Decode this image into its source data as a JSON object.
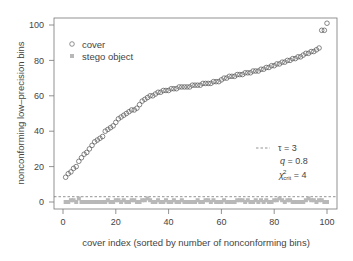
{
  "chart_data": {
    "type": "scatter",
    "title": "",
    "xlabel": "cover index (sorted by number of nonconforming bins)",
    "ylabel": "nonconforming low–precision bins",
    "xlim": [
      -2,
      104
    ],
    "ylim": [
      -4,
      104
    ],
    "xticks": [
      0,
      20,
      40,
      60,
      80,
      100
    ],
    "yticks": [
      0,
      20,
      40,
      60,
      80,
      100
    ],
    "grid": false,
    "legend_position": "top-left",
    "series": [
      {
        "name": "cover",
        "marker": "open-circle",
        "color": "#555555",
        "x": [
          1,
          2,
          3,
          4,
          5,
          6,
          7,
          8,
          9,
          10,
          11,
          12,
          13,
          14,
          15,
          16,
          17,
          18,
          19,
          20,
          21,
          22,
          23,
          24,
          25,
          26,
          27,
          28,
          29,
          30,
          31,
          32,
          33,
          34,
          35,
          36,
          37,
          38,
          39,
          40,
          41,
          42,
          43,
          44,
          45,
          46,
          47,
          48,
          49,
          50,
          51,
          52,
          53,
          54,
          55,
          56,
          57,
          58,
          59,
          60,
          61,
          62,
          63,
          64,
          65,
          66,
          67,
          68,
          69,
          70,
          71,
          72,
          73,
          74,
          75,
          76,
          77,
          78,
          79,
          80,
          81,
          82,
          83,
          84,
          85,
          86,
          87,
          88,
          89,
          90,
          91,
          92,
          93,
          94,
          95,
          96,
          97,
          98,
          99,
          100
        ],
        "values": [
          14,
          16,
          17,
          19,
          20,
          23,
          25,
          27,
          28,
          30,
          32,
          34,
          35,
          36,
          37,
          40,
          41,
          42,
          43,
          45,
          47,
          48,
          49,
          50,
          51,
          52,
          52,
          53,
          55,
          57,
          58,
          59,
          60,
          60,
          61,
          62,
          62,
          63,
          63,
          63,
          64,
          64,
          64,
          65,
          65,
          65,
          65,
          65,
          66,
          66,
          66,
          66,
          67,
          67,
          67,
          67,
          68,
          68,
          68,
          69,
          70,
          70,
          71,
          71,
          71,
          72,
          72,
          72,
          73,
          73,
          73,
          74,
          74,
          74,
          75,
          75,
          76,
          76,
          77,
          77,
          78,
          78,
          79,
          79,
          80,
          80,
          81,
          81,
          82,
          82,
          83,
          84,
          84,
          85,
          85,
          86,
          87,
          97,
          97,
          101
        ]
      },
      {
        "name": "stego object",
        "marker": "filled-square",
        "color": "#b0b0b0",
        "x": [
          1,
          2,
          3,
          4,
          5,
          6,
          7,
          8,
          9,
          10,
          11,
          12,
          13,
          14,
          15,
          16,
          17,
          18,
          19,
          20,
          21,
          22,
          23,
          24,
          25,
          26,
          27,
          28,
          29,
          30,
          31,
          32,
          33,
          34,
          35,
          36,
          37,
          38,
          39,
          40,
          41,
          42,
          43,
          44,
          45,
          46,
          47,
          48,
          49,
          50,
          51,
          52,
          53,
          54,
          55,
          56,
          57,
          58,
          59,
          60,
          61,
          62,
          63,
          64,
          65,
          66,
          67,
          68,
          69,
          70,
          71,
          72,
          73,
          74,
          75,
          76,
          77,
          78,
          79,
          80,
          81,
          82,
          83,
          84,
          85,
          86,
          87,
          88,
          89,
          90,
          91,
          92,
          93,
          94,
          95,
          96,
          97,
          98,
          99,
          100
        ],
        "values": [
          0,
          0,
          1,
          1,
          0,
          2,
          0,
          0,
          0,
          0,
          0,
          0,
          0,
          0,
          0,
          0,
          1,
          0,
          0,
          1,
          1,
          0,
          1,
          0,
          0,
          1,
          1,
          0,
          0,
          1,
          1,
          2,
          1,
          0,
          0,
          1,
          0,
          0,
          1,
          0,
          0,
          1,
          0,
          0,
          1,
          0,
          0,
          0,
          0,
          0,
          1,
          0,
          0,
          1,
          1,
          0,
          1,
          0,
          0,
          0,
          1,
          0,
          0,
          0,
          0,
          1,
          1,
          1,
          0,
          1,
          0,
          0,
          1,
          0,
          1,
          0,
          1,
          0,
          0,
          1,
          1,
          2,
          1,
          0,
          1,
          1,
          0,
          0,
          0,
          0,
          0,
          1,
          2,
          1,
          1,
          0,
          1,
          1,
          0,
          0
        ]
      }
    ],
    "reference_lines": [
      {
        "orientation": "horizontal",
        "y": 3,
        "style": "dashed",
        "label": "τ = 3"
      }
    ],
    "annotations": [
      {
        "text": "τ = 3",
        "position": "lower-right"
      },
      {
        "text": "q = 0.8",
        "position": "lower-right"
      },
      {
        "text": "χ²crit = 4",
        "position": "lower-right"
      }
    ]
  },
  "legend": {
    "cover": "cover",
    "stego": "stego object"
  },
  "annotation": {
    "tau_label": "τ = 3",
    "q_var": "q",
    "q_value": " = 0.8",
    "chi_var": "χ",
    "chi_sup": "2",
    "chi_sub": "crit",
    "chi_value": " = 4"
  },
  "axes": {
    "xlabel": "cover index (sorted by number of nonconforming bins)",
    "ylabel": "nonconforming low–precision bins",
    "xticks": [
      "0",
      "20",
      "40",
      "60",
      "80",
      "100"
    ],
    "yticks": [
      "0",
      "20",
      "40",
      "60",
      "80",
      "100"
    ]
  }
}
